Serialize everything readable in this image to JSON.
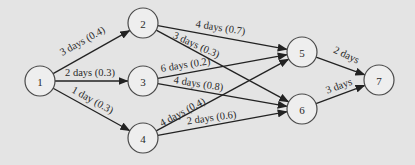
{
  "diagram": {
    "type": "activity-network",
    "background_color": "#e4e4e4",
    "node_fill": "#eeeeee",
    "node_stroke": "#4a4a4a",
    "edge_color": "#222222",
    "node_radius": 15,
    "nodes": [
      {
        "id": "1",
        "label": "1",
        "x": 40,
        "y": 81
      },
      {
        "id": "2",
        "label": "2",
        "x": 143,
        "y": 23
      },
      {
        "id": "3",
        "label": "3",
        "x": 143,
        "y": 81
      },
      {
        "id": "4",
        "label": "4",
        "x": 143,
        "y": 138
      },
      {
        "id": "5",
        "label": "5",
        "x": 302,
        "y": 52
      },
      {
        "id": "6",
        "label": "6",
        "x": 302,
        "y": 109
      },
      {
        "id": "7",
        "label": "7",
        "x": 379,
        "y": 80
      }
    ],
    "edges": [
      {
        "from": "1",
        "to": "2",
        "label": "3 days (0.4)",
        "lx": 84,
        "ly": 44,
        "rot": -29
      },
      {
        "from": "1",
        "to": "3",
        "label": "2 days (0.3)",
        "lx": 90,
        "ly": 76,
        "rot": 0
      },
      {
        "from": "1",
        "to": "4",
        "label": "1 day (0.3)",
        "lx": 91,
        "ly": 103,
        "rot": 29
      },
      {
        "from": "2",
        "to": "5",
        "label": "4 days (0.7)",
        "lx": 220,
        "ly": 31,
        "rot": 9
      },
      {
        "from": "2",
        "to": "6",
        "label": "3 days (0.3)",
        "lx": 195,
        "ly": 48,
        "rot": 24
      },
      {
        "from": "3",
        "to": "5",
        "label": "6 days (0.2)",
        "lx": 186,
        "ly": 68,
        "rot": -9
      },
      {
        "from": "3",
        "to": "6",
        "label": "4 days (0.8)",
        "lx": 198,
        "ly": 87,
        "rot": 9
      },
      {
        "from": "4",
        "to": "5",
        "label": "4 days (0.4)",
        "lx": 184,
        "ly": 115,
        "rot": -28
      },
      {
        "from": "4",
        "to": "6",
        "label": "2 days (0.6)",
        "lx": 212,
        "ly": 121,
        "rot": -8
      },
      {
        "from": "5",
        "to": "7",
        "label": "2 days",
        "lx": 345,
        "ly": 58,
        "rot": 25
      },
      {
        "from": "6",
        "to": "7",
        "label": "3 days",
        "lx": 340,
        "ly": 89,
        "rot": -20
      }
    ]
  }
}
